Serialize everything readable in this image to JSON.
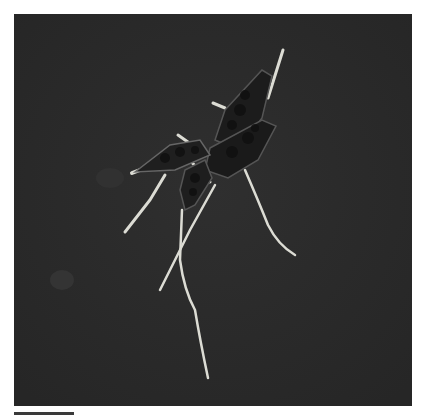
{
  "image": {
    "description": "Phase-contrast micrograph of germinating multicellular fungal conidia with hyphae on a dark background",
    "background_color": "#2b2b2b",
    "frame_color": "#ffffff",
    "structure_color": "#1a1a1a",
    "hyphae_color": "#d8d8d0"
  }
}
